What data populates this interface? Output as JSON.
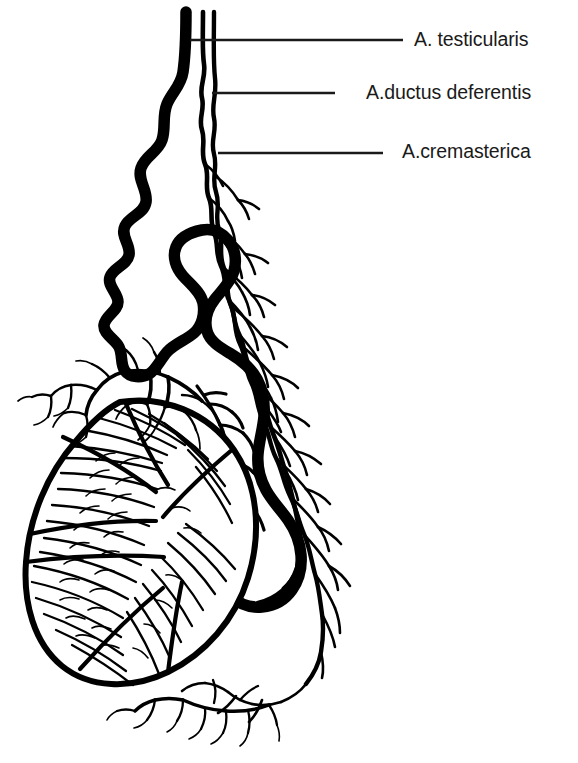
{
  "figure": {
    "name": "arterial-supply-of-testis-diagram",
    "background_color": "#ffffff",
    "ink_color": "#000000",
    "text_color": "#1a1a1a",
    "width": 578,
    "height": 763
  },
  "labels": [
    {
      "id": "testicularis",
      "text": "A. testicularis",
      "leader_line": {
        "x1": 190,
        "y1": 40,
        "x2": 403,
        "y2": 40
      }
    },
    {
      "id": "ductus-deferentis",
      "text": "A.ductus deferentis",
      "leader_line": {
        "x1": 212,
        "y1": 93,
        "x2": 335,
        "y2": 93
      }
    },
    {
      "id": "cremasterica",
      "text": "A.cremasterica",
      "leader_line": {
        "x1": 218,
        "y1": 153,
        "x2": 383,
        "y2": 153
      }
    }
  ],
  "structures": {
    "testicular_artery": "thick tortuous serpentine artery descending from the spermatic cord and curving around the testis",
    "artery_of_ductus_deferens": "thin wavy artery running parallel and lateral to the testicular artery",
    "cremasteric_artery": "thin wavy artery lateral-most in the cord, branching over the epididymis",
    "testis": "oval organ with thick outline and radiating intratesticular branches",
    "epididymis": "branching vascular plexus along the posterolateral margin of the testis"
  }
}
